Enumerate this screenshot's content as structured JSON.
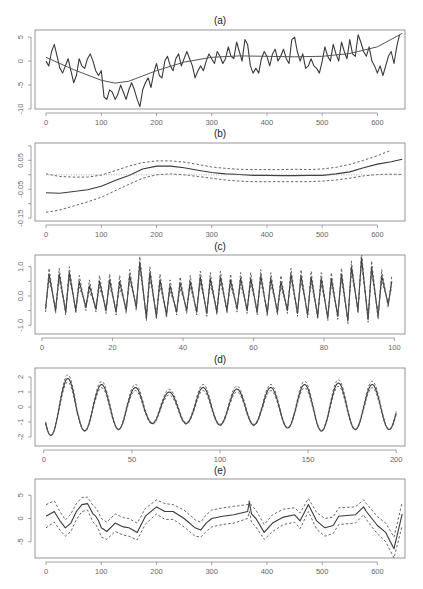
{
  "chart_data": [
    {
      "id": "a",
      "type": "line",
      "title": "(a)",
      "xlabel": "",
      "ylabel": "",
      "xlim": [
        -20,
        650
      ],
      "ylim": [
        -10,
        6.5
      ],
      "xticks": [
        0,
        100,
        200,
        300,
        400,
        500,
        600
      ],
      "yticks": [
        -10,
        -5,
        0,
        5
      ],
      "grid": false,
      "series": [
        {
          "name": "observed",
          "style": "main",
          "x": [
            0,
            5,
            10,
            15,
            20,
            25,
            30,
            35,
            40,
            45,
            50,
            55,
            60,
            65,
            70,
            75,
            80,
            85,
            90,
            95,
            100,
            105,
            110,
            115,
            120,
            125,
            130,
            135,
            140,
            145,
            150,
            155,
            160,
            165,
            170,
            175,
            180,
            185,
            190,
            195,
            200,
            205,
            210,
            215,
            220,
            225,
            230,
            235,
            240,
            245,
            250,
            255,
            260,
            265,
            270,
            275,
            280,
            285,
            290,
            295,
            300,
            305,
            310,
            315,
            320,
            325,
            330,
            335,
            340,
            345,
            350,
            355,
            360,
            365,
            370,
            375,
            380,
            385,
            390,
            395,
            400,
            405,
            410,
            415,
            420,
            425,
            430,
            435,
            440,
            445,
            450,
            455,
            460,
            465,
            470,
            475,
            480,
            485,
            490,
            495,
            500,
            505,
            510,
            515,
            520,
            525,
            530,
            535,
            540,
            545,
            550,
            555,
            560,
            565,
            570,
            575,
            580,
            585,
            590,
            595,
            600,
            605,
            610,
            615,
            620,
            625,
            630,
            635,
            640,
            645
          ],
          "y": [
            0,
            -1,
            2,
            3.5,
            1,
            -1.5,
            -2.5,
            -1,
            0.5,
            -2,
            -4.5,
            -3,
            0.5,
            -1,
            -1.5,
            0.5,
            1.5,
            0,
            -2,
            -3,
            -2,
            -7.5,
            -8,
            -6,
            -6.5,
            -8,
            -7,
            -5,
            -6.5,
            -8,
            -6,
            -4.5,
            -6,
            -8,
            -9.5,
            -6,
            -4.5,
            -3.5,
            -5.5,
            -2.5,
            -0.5,
            -3,
            -3.5,
            0,
            1,
            -1,
            -2,
            0.5,
            1.5,
            -1,
            0.5,
            2,
            0.5,
            -1,
            -3.5,
            -2,
            -1,
            -2,
            0,
            1.5,
            0.5,
            -0.5,
            2,
            1,
            -0.5,
            0.5,
            3,
            1,
            0.5,
            4,
            2,
            0,
            4.5,
            3.5,
            -1,
            -2.5,
            -1.5,
            -2.5,
            0.5,
            2,
            1,
            -1,
            1.5,
            2.5,
            0,
            1,
            2.5,
            0.5,
            -0.5,
            4.5,
            5,
            2,
            0,
            1.5,
            -1.5,
            -1,
            0.5,
            -1,
            -1.5,
            -2.5,
            0,
            3,
            1,
            0,
            3.5,
            1.5,
            0,
            4,
            2,
            0.5,
            4.5,
            1.5,
            1,
            5.5,
            4,
            2,
            1,
            3,
            0,
            -1,
            -2.5,
            -1,
            -3,
            -1,
            1,
            2,
            -0.5,
            3,
            5.5
          ]
        },
        {
          "name": "smooth",
          "style": "smooth",
          "x": [
            0,
            50,
            100,
            125,
            150,
            200,
            250,
            300,
            350,
            400,
            450,
            500,
            550,
            600,
            645
          ],
          "y": [
            0.8,
            -1.8,
            -4,
            -4.6,
            -4.2,
            -2,
            -0.2,
            0.8,
            1.1,
            1.0,
            0.9,
            1.0,
            1.6,
            3,
            5.8
          ]
        }
      ]
    },
    {
      "id": "b",
      "type": "line",
      "title": "(b)",
      "xlabel": "",
      "ylabel": "",
      "xlim": [
        -20,
        650
      ],
      "ylim": [
        -0.16,
        0.11
      ],
      "xticks": [
        0,
        100,
        200,
        300,
        400,
        500,
        600
      ],
      "yticks": [
        -0.15,
        -0.1,
        -0.05,
        0.0,
        0.05,
        0.1
      ],
      "ytick_labels": [
        "-0.15",
        "",
        "-0.05",
        "",
        "0.05",
        ""
      ],
      "grid": false,
      "series": [
        {
          "name": "estimate",
          "style": "main",
          "x": [
            0,
            25,
            50,
            75,
            100,
            125,
            150,
            175,
            200,
            225,
            250,
            275,
            300,
            325,
            350,
            375,
            400,
            425,
            450,
            475,
            500,
            525,
            550,
            575,
            600,
            625,
            645
          ],
          "y": [
            -0.062,
            -0.064,
            -0.058,
            -0.052,
            -0.04,
            -0.02,
            -0.002,
            0.02,
            0.03,
            0.03,
            0.024,
            0.016,
            0.008,
            0.003,
            0.001,
            -0.002,
            -0.002,
            -0.003,
            -0.003,
            -0.002,
            -0.002,
            0.003,
            0.01,
            0.024,
            0.037,
            0.045,
            0.054
          ]
        },
        {
          "name": "upper",
          "style": "band",
          "x": [
            0,
            25,
            50,
            75,
            100,
            125,
            150,
            175,
            200,
            225,
            250,
            275,
            300,
            325,
            350,
            375,
            400,
            425,
            450,
            475,
            500,
            525,
            550,
            575,
            600,
            625
          ],
          "y": [
            0.003,
            -0.006,
            -0.008,
            -0.008,
            -0.001,
            0.014,
            0.03,
            0.042,
            0.048,
            0.048,
            0.044,
            0.036,
            0.027,
            0.022,
            0.019,
            0.018,
            0.018,
            0.018,
            0.019,
            0.018,
            0.02,
            0.026,
            0.036,
            0.05,
            0.066,
            0.085
          ]
        },
        {
          "name": "lower",
          "style": "band",
          "x": [
            0,
            25,
            50,
            75,
            100,
            125,
            150,
            175,
            200,
            225,
            250,
            275,
            300,
            325,
            350,
            375,
            400,
            425,
            450,
            475,
            500,
            525,
            550,
            575,
            600,
            625,
            645
          ],
          "y": [
            -0.13,
            -0.122,
            -0.108,
            -0.094,
            -0.078,
            -0.055,
            -0.033,
            -0.012,
            0.0,
            0.003,
            0.0,
            -0.006,
            -0.012,
            -0.018,
            -0.022,
            -0.024,
            -0.024,
            -0.024,
            -0.024,
            -0.024,
            -0.022,
            -0.018,
            -0.012,
            -0.004,
            0.001,
            0.002,
            0.001
          ]
        },
        {
          "name": "zero-reference",
          "style": "dotref",
          "x": [
            0,
            645
          ],
          "y": [
            0,
            0
          ]
        }
      ]
    },
    {
      "id": "c",
      "type": "line",
      "title": "(c)",
      "xlabel": "",
      "ylabel": "",
      "xlim": [
        -2,
        103
      ],
      "ylim": [
        -1.3,
        1.4
      ],
      "xticks": [
        0,
        20,
        40,
        60,
        80,
        100
      ],
      "yticks": [
        -1.0,
        -0.5,
        0.0,
        0.5,
        1.0
      ],
      "ytick_labels": [
        "-1.0",
        "",
        "0.0",
        "",
        "1.0"
      ],
      "grid": false,
      "peaks": [
        0.75,
        0.75,
        0.8,
        0.5,
        0.35,
        0.5,
        0.55,
        0.5,
        0.7,
        1.15,
        0.8,
        0.55,
        0.35,
        0.45,
        0.5,
        0.65,
        0.6,
        0.65,
        0.55,
        0.6,
        0.6,
        0.7,
        0.6,
        0.5,
        0.75,
        0.7,
        0.65,
        0.6,
        0.6,
        0.75,
        1.0,
        1.3,
        1.0,
        0.7,
        0.5
      ],
      "troughs": [
        -0.45,
        -0.5,
        -0.55,
        -0.5,
        -0.4,
        -0.45,
        -0.5,
        -0.55,
        -0.5,
        -0.4,
        -0.75,
        -0.7,
        -0.65,
        -0.55,
        -0.5,
        -0.55,
        -0.6,
        -0.55,
        -0.5,
        -0.45,
        -0.5,
        -0.55,
        -0.6,
        -0.55,
        -0.5,
        -0.6,
        -0.65,
        -0.7,
        -0.75,
        -0.7,
        -0.85,
        -0.5,
        -0.8,
        -0.7,
        -0.3
      ],
      "series": [
        {
          "name": "estimate",
          "style": "main"
        },
        {
          "name": "upper",
          "style": "band",
          "offset": 0.25
        },
        {
          "name": "lower",
          "style": "band",
          "offset": -0.25
        }
      ]
    },
    {
      "id": "d",
      "type": "line",
      "title": "(d)",
      "xlabel": "",
      "ylabel": "",
      "xlim": [
        -5,
        205
      ],
      "ylim": [
        -2.6,
        2.6
      ],
      "xticks": [
        0,
        50,
        100,
        150,
        200
      ],
      "yticks": [
        -2,
        -1,
        0,
        1,
        2
      ],
      "grid": false,
      "period": 19.2,
      "amplitudes": [
        1.9,
        1.9,
        1.6,
        1.5,
        1.5,
        1.3,
        1.1,
        1.0,
        1.1,
        1.3,
        1.2,
        1.2,
        1.2,
        1.3,
        1.4,
        1.5,
        1.6,
        1.6,
        1.5,
        1.5,
        1.5
      ],
      "series": [
        {
          "name": "estimate",
          "style": "main"
        },
        {
          "name": "upper",
          "style": "band",
          "offset": 0.35
        },
        {
          "name": "lower",
          "style": "band",
          "offset": -0.35
        }
      ]
    },
    {
      "id": "e",
      "type": "line",
      "title": "(e)",
      "xlabel": "",
      "ylabel": "",
      "xlim": [
        -20,
        650
      ],
      "ylim": [
        -8.5,
        8.5
      ],
      "xticks": [
        0,
        100,
        200,
        300,
        400,
        500,
        600
      ],
      "yticks": [
        -5,
        0,
        5
      ],
      "grid": false,
      "series": [
        {
          "name": "estimate",
          "style": "main",
          "x": [
            0,
            15,
            25,
            35,
            45,
            55,
            65,
            75,
            85,
            90,
            95,
            100,
            110,
            125,
            140,
            150,
            165,
            180,
            200,
            215,
            230,
            250,
            270,
            280,
            290,
            300,
            320,
            340,
            365,
            368,
            372,
            380,
            395,
            410,
            430,
            450,
            460,
            475,
            490,
            505,
            520,
            530,
            560,
            575,
            580,
            590,
            600,
            615,
            630,
            645
          ],
          "y": [
            0.5,
            1.5,
            -0.5,
            -2,
            -1,
            1.5,
            3,
            3.2,
            1,
            0.5,
            -0.5,
            -2,
            -2.8,
            -1,
            -1.8,
            -2,
            -3,
            0.5,
            2.5,
            1.5,
            1.5,
            0,
            -2,
            -2.5,
            -1,
            0,
            0.5,
            0.8,
            1.5,
            3.5,
            1,
            0,
            -3,
            -1,
            0.3,
            0.8,
            -0.5,
            3,
            -0.5,
            -2,
            -1.5,
            0.5,
            0.8,
            2.5,
            1.5,
            0,
            -1.5,
            -3,
            -6.5,
            1
          ]
        },
        {
          "name": "upper",
          "style": "band",
          "x": [
            0,
            15,
            25,
            35,
            45,
            55,
            65,
            75,
            85,
            90,
            95,
            100,
            110,
            125,
            140,
            150,
            165,
            180,
            200,
            215,
            230,
            250,
            270,
            280,
            290,
            300,
            320,
            340,
            365,
            368,
            372,
            380,
            395,
            410,
            430,
            450,
            460,
            475,
            490,
            505,
            520,
            530,
            560,
            575,
            580,
            590,
            600,
            615,
            630,
            645
          ],
          "y": [
            3,
            3.8,
            1.5,
            -0.3,
            1,
            3.2,
            4.5,
            4.6,
            2.8,
            2.3,
            1.3,
            0,
            -0.8,
            1,
            0.2,
            0,
            -1,
            2.2,
            4,
            3.2,
            3,
            1.8,
            -0.3,
            -0.8,
            0.8,
            1.8,
            2.3,
            2.6,
            3,
            3.8,
            2.8,
            1.8,
            -1.3,
            0.8,
            2,
            2.3,
            1.2,
            4.3,
            1.3,
            0,
            0.3,
            2.3,
            2.5,
            4,
            3.2,
            1.8,
            0.4,
            -1,
            -4,
            3.5
          ]
        },
        {
          "name": "lower",
          "style": "band",
          "x": [
            0,
            15,
            25,
            35,
            45,
            55,
            65,
            75,
            85,
            90,
            95,
            100,
            110,
            125,
            140,
            150,
            165,
            180,
            200,
            215,
            230,
            250,
            270,
            280,
            290,
            300,
            320,
            340,
            365,
            368,
            372,
            380,
            395,
            410,
            430,
            450,
            460,
            475,
            490,
            505,
            520,
            530,
            560,
            575,
            580,
            590,
            600,
            615,
            630,
            645
          ],
          "y": [
            -2,
            -0.8,
            -2.5,
            -3.8,
            -2.8,
            -0.2,
            1.5,
            1.8,
            -0.8,
            -1.3,
            -2.3,
            -4,
            -4.5,
            -2.8,
            -3.6,
            -3.8,
            -4.6,
            -1.2,
            1,
            -0.2,
            -0.2,
            -1.8,
            -3.8,
            -4,
            -2.8,
            -1.8,
            -1.3,
            -1,
            0,
            1.5,
            -0.8,
            -1.8,
            -4.5,
            -2.8,
            -1.3,
            -0.8,
            -2.2,
            1.5,
            -2.3,
            -3.8,
            -3.2,
            -1.3,
            -1,
            0.8,
            -0.2,
            -1.8,
            -3.3,
            -5,
            -8.5,
            -1.5
          ]
        }
      ]
    }
  ]
}
